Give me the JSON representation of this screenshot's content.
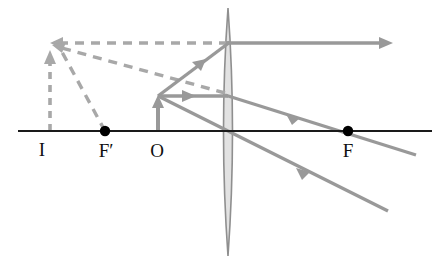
{
  "figure": {
    "type": "optics-ray-diagram",
    "width": 445,
    "height": 264,
    "background_color": "#ffffff"
  },
  "colors": {
    "axis": "#1a1a1a",
    "ray_solid": "#999999",
    "ray_dashed": "#a8a8a8",
    "lens_fill": "#e2e2e2",
    "lens_stroke": "#8f8f8f",
    "point_dot": "#000000",
    "label_text": "#101010"
  },
  "labels": [
    {
      "id": "image-label",
      "text": "I",
      "x": 47,
      "y": 155
    },
    {
      "id": "near-focus-label",
      "text": "F′",
      "x": 99,
      "y": 156
    },
    {
      "id": "object-label",
      "text": "O",
      "x": 151,
      "y": 156
    },
    {
      "id": "far-focus-label",
      "text": "F",
      "x": 343,
      "y": 156
    }
  ],
  "optical_axis": {
    "name": "optical-axis",
    "x1": 18,
    "y1": 131,
    "x2": 432,
    "y2": 131,
    "stroke_width": 2.2
  },
  "lens": {
    "name": "converging-lens",
    "center_x": 228,
    "top_y": 8,
    "bottom_y": 256,
    "half_width": 9,
    "shape": "biconvex"
  },
  "focal_points": [
    {
      "id": "focus-near",
      "label": "F′",
      "x": 105,
      "y": 131,
      "radius": 5
    },
    {
      "id": "focus-far",
      "label": "F",
      "x": 348,
      "y": 131,
      "radius": 5
    }
  ],
  "object": {
    "name": "object-arrow",
    "base_x": 158,
    "base_y": 131,
    "tip_x": 158,
    "tip_y": 96,
    "style": "solid",
    "direction": "up"
  },
  "image": {
    "name": "virtual-image-arrow",
    "base_x": 50,
    "base_y": 131,
    "tip_x": 50,
    "tip_y": 51,
    "style": "dashed",
    "direction": "up"
  },
  "solid_rays": [
    {
      "id": "ray-parallel-incident",
      "desc": "object tip up-right to lens top region",
      "points": [
        [
          158,
          96
        ],
        [
          228,
          43
        ]
      ],
      "arrow_at": 0.62
    },
    {
      "id": "ray-parallel-refracted",
      "desc": "refracted horizontal ray leaving lens to the right",
      "points": [
        [
          228,
          43
        ],
        [
          392,
          43
        ]
      ],
      "arrow_at": 1.0
    },
    {
      "id": "ray-center-incident",
      "desc": "object tip horizontal toward lens center line",
      "points": [
        [
          158,
          96
        ],
        [
          228,
          96
        ]
      ],
      "arrow_at": 0.48
    },
    {
      "id": "ray-center-refracted",
      "desc": "ray continuing through lens, crossing axis near F",
      "points": [
        [
          228,
          96
        ],
        [
          416,
          155
        ]
      ],
      "arrow_at": 0.4
    },
    {
      "id": "ray-through-vertex",
      "desc": "ray from object tip down-right through lens vertex on the axis",
      "points": [
        [
          158,
          96
        ],
        [
          228,
          131
        ],
        [
          388,
          211
        ]
      ],
      "arrow_at": 0.74
    }
  ],
  "dashed_rays": [
    {
      "id": "dashed-parallel-backward",
      "desc": "horizontal backward extension to image tip",
      "points": [
        [
          228,
          43
        ],
        [
          52,
          43
        ]
      ],
      "arrow_at": 1.0
    },
    {
      "id": "dashed-center-backward",
      "desc": "backward extension of refracted central ray to image tip",
      "points": [
        [
          225,
          93
        ],
        [
          54,
          46
        ]
      ],
      "arrow_at": 0.0
    },
    {
      "id": "dashed-vertex-backward",
      "desc": "backward extension through F′ to image tip",
      "points": [
        [
          105,
          131
        ],
        [
          55,
          49
        ]
      ],
      "arrow_at": 0.0
    }
  ]
}
